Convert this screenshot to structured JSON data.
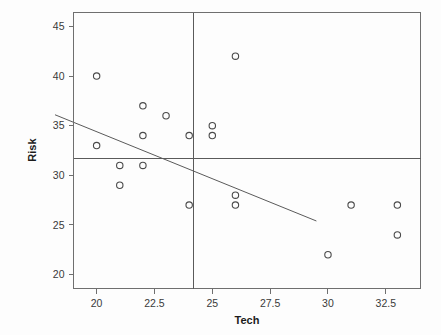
{
  "chart_data": {
    "type": "scatter",
    "title": "",
    "xlabel": "Tech",
    "ylabel": "Risk",
    "xlim": [
      19.0,
      34.0
    ],
    "ylim": [
      18.6,
      46.4
    ],
    "xticks": [
      20,
      22.5,
      25,
      27.5,
      30,
      32.5
    ],
    "xtick_labels": [
      "20",
      "22.5",
      "25",
      "27.5",
      "30",
      "32.5"
    ],
    "yticks": [
      20,
      25,
      30,
      35,
      40,
      45
    ],
    "ytick_labels": [
      "20",
      "25",
      "30",
      "35",
      "40",
      "45"
    ],
    "grid": false,
    "legend": null,
    "points": [
      {
        "x": 20,
        "y": 40
      },
      {
        "x": 20,
        "y": 33
      },
      {
        "x": 21,
        "y": 31
      },
      {
        "x": 21,
        "y": 29
      },
      {
        "x": 22,
        "y": 37
      },
      {
        "x": 22,
        "y": 34
      },
      {
        "x": 22,
        "y": 31
      },
      {
        "x": 23,
        "y": 36
      },
      {
        "x": 24,
        "y": 34
      },
      {
        "x": 24,
        "y": 27
      },
      {
        "x": 25,
        "y": 35
      },
      {
        "x": 25,
        "y": 34
      },
      {
        "x": 26,
        "y": 42
      },
      {
        "x": 26,
        "y": 28
      },
      {
        "x": 26,
        "y": 27
      },
      {
        "x": 30,
        "y": 22
      },
      {
        "x": 31,
        "y": 27
      },
      {
        "x": 33,
        "y": 27
      },
      {
        "x": 33,
        "y": 24
      }
    ],
    "reference_lines": [
      {
        "name": "vertical-mean-line",
        "orientation": "vertical",
        "value": 24.2
      },
      {
        "name": "horizontal-mean-line",
        "orientation": "horizontal",
        "value": 31.7
      }
    ],
    "fit_line": {
      "name": "regression-line",
      "x_start": 18.2,
      "y_start": 36.1,
      "x_end": 29.5,
      "y_end": 25.4
    },
    "marker": {
      "shape": "open-circle",
      "radius_px": 3.2,
      "stroke": "#4a4a4a"
    },
    "colors": {
      "background": "#fdfdfd",
      "frame": "#6f6f6f",
      "text": "#1c1c1c",
      "tick_text": "#3a3a3a",
      "reference_line": "#5a5a5a",
      "fit_line": "#5a5a5a"
    }
  }
}
